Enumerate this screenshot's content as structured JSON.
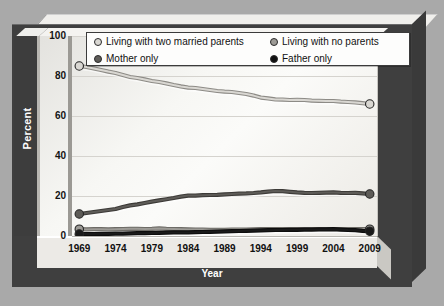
{
  "chart_data": {
    "type": "line",
    "title": "",
    "xlabel": "Year",
    "ylabel": "Percent",
    "xlim": [
      1968,
      2010
    ],
    "ylim": [
      0,
      100
    ],
    "yticks": [
      0,
      20,
      40,
      60,
      80,
      100
    ],
    "xticks": [
      1969,
      1974,
      1979,
      1984,
      1989,
      1994,
      1999,
      2004,
      2009
    ],
    "grid": true,
    "legend_position": "top",
    "x": [
      1969,
      1970,
      1971,
      1972,
      1973,
      1974,
      1975,
      1976,
      1977,
      1978,
      1979,
      1980,
      1981,
      1982,
      1983,
      1984,
      1985,
      1986,
      1987,
      1988,
      1989,
      1990,
      1991,
      1992,
      1993,
      1994,
      1995,
      1996,
      1997,
      1998,
      1999,
      2000,
      2001,
      2002,
      2003,
      2004,
      2005,
      2006,
      2007,
      2008,
      2009
    ],
    "series": [
      {
        "name": "Living with two married parents",
        "color": "#d9d7d2",
        "line_color": "#8d8b86",
        "values": [
          85,
          84.5,
          83.8,
          83,
          82.2,
          81.5,
          80.5,
          79.5,
          79,
          78.3,
          77.5,
          77,
          76.3,
          75.5,
          74.8,
          74.2,
          74,
          73.5,
          73,
          72.5,
          72.2,
          72,
          71.5,
          71,
          70.2,
          69.2,
          68.8,
          68.3,
          68.2,
          68,
          68.1,
          68,
          67.7,
          67.6,
          67.5,
          67.5,
          67.2,
          67,
          66.8,
          66.4,
          66
        ]
      },
      {
        "name": "Living with no parents",
        "color": "#9d9b96",
        "line_color": "#6d6b66",
        "values": [
          3.4,
          3.3,
          3.4,
          3.4,
          3.3,
          3.4,
          3.5,
          3.6,
          3.6,
          3.5,
          3.6,
          3.8,
          3.6,
          3.5,
          3.4,
          3.3,
          3.2,
          3.2,
          3.1,
          3.1,
          3.1,
          3.2,
          3.2,
          3.2,
          3.3,
          3.4,
          3.4,
          3.4,
          3.4,
          3.5,
          3.5,
          3.5,
          3.5,
          3.4,
          3.4,
          3.4,
          3.4,
          3.4,
          3.4,
          3.4,
          3.4
        ]
      },
      {
        "name": "Mother only",
        "color": "#5e5c58",
        "line_color": "#3c3a37",
        "values": [
          11,
          11.5,
          12,
          12.5,
          13,
          13.5,
          14.5,
          15.3,
          15.8,
          16.5,
          17.2,
          17.8,
          18.4,
          19,
          19.7,
          20.2,
          20.2,
          20.4,
          20.5,
          20.6,
          20.8,
          21,
          21.2,
          21.3,
          21.5,
          21.8,
          22.2,
          22.5,
          22.4,
          22.1,
          21.8,
          21.6,
          21.5,
          21.6,
          21.7,
          21.8,
          21.6,
          21.5,
          21.6,
          21.3,
          21
        ]
      },
      {
        "name": "Father only",
        "color": "#1a1a1a",
        "line_color": "#0d0d0d",
        "values": [
          1,
          1,
          1,
          1.1,
          1.1,
          1.2,
          1.2,
          1.3,
          1.4,
          1.4,
          1.5,
          1.6,
          1.7,
          1.8,
          1.8,
          1.8,
          1.9,
          2,
          2.1,
          2.2,
          2.3,
          2.4,
          2.5,
          2.6,
          2.7,
          2.8,
          2.9,
          3,
          3,
          3.1,
          3.1,
          3.2,
          3.2,
          3.3,
          3.3,
          3.4,
          3.2,
          3,
          2.9,
          2.6,
          2.4
        ]
      }
    ]
  },
  "axes": {
    "ylabel": "Percent",
    "xlabel": "Year",
    "yticks": [
      "100",
      "80",
      "60",
      "40",
      "20",
      "0"
    ],
    "xticks": [
      "1969",
      "1974",
      "1979",
      "1984",
      "1989",
      "1994",
      "1999",
      "2004",
      "2009"
    ]
  },
  "legend": {
    "items": [
      {
        "label": "Living with two married parents",
        "marker": "#d9d7d2"
      },
      {
        "label": "Living with no parents",
        "marker": "#9d9b96"
      },
      {
        "label": "Mother only",
        "marker": "#5e5c58"
      },
      {
        "label": "Father only",
        "marker": "#101010"
      }
    ]
  }
}
